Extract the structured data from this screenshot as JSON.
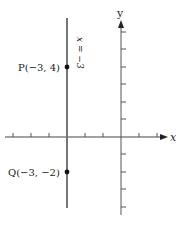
{
  "diagram": {
    "type": "coordinate-plane",
    "axes": {
      "x_label": "x",
      "y_label": "y",
      "x_range": [
        -6,
        3
      ],
      "y_range": [
        -4,
        6
      ]
    },
    "vertical_line": {
      "equation": "x = −3",
      "x": -3
    },
    "points": [
      {
        "name": "P",
        "label": "P(−3, 4)",
        "x": -3,
        "y": 4
      },
      {
        "name": "Q",
        "label": "Q(−3, −2)",
        "x": -3,
        "y": -2
      }
    ],
    "colors": {
      "axis": "#444444",
      "line": "#777777",
      "point": "#111111",
      "text": "#222222"
    }
  }
}
